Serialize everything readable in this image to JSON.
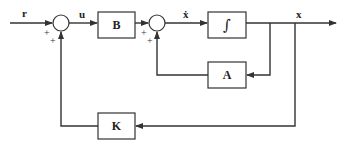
{
  "diagram": {
    "type": "block-diagram",
    "signals": {
      "input": "r",
      "control": "u",
      "state_derivative": "ẋ",
      "state": "x"
    },
    "blocks": {
      "B": "B",
      "integrator": "∫",
      "A": "A",
      "K": "K"
    },
    "summing_junctions": [
      {
        "id": "sum1",
        "signs": [
          "+",
          "+"
        ]
      },
      {
        "id": "sum2",
        "signs": [
          "+",
          "+"
        ]
      }
    ],
    "colors": {
      "line": "#333333",
      "background": "#ffffff"
    }
  }
}
